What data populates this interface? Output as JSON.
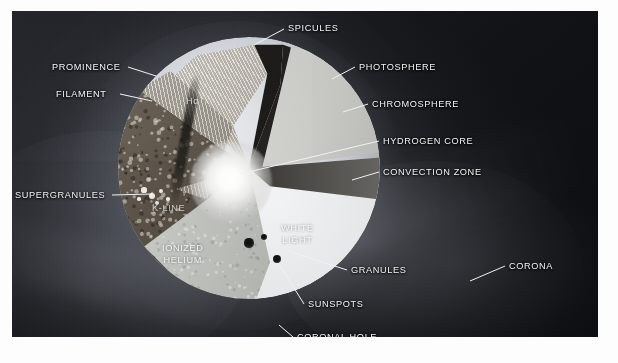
{
  "figure": {
    "background_color": "#14151a",
    "label_color": "#f3f4f6"
  },
  "callouts": [
    {
      "id": "spicules",
      "label": "SPICULES",
      "text_x": 288,
      "text_y": 23,
      "align": "left",
      "leader": [
        284,
        29,
        254,
        45
      ]
    },
    {
      "id": "photosphere",
      "label": "PHOTOSPHERE",
      "text_x": 359,
      "text_y": 62,
      "align": "left",
      "leader": [
        355,
        67,
        332,
        79
      ]
    },
    {
      "id": "chromosphere",
      "label": "CHROMOSPHERE",
      "text_x": 372,
      "text_y": 99,
      "align": "left",
      "leader": [
        368,
        104,
        343,
        112
      ]
    },
    {
      "id": "hydrogen-core",
      "label": "HYDROGEN CORE",
      "text_x": 383,
      "text_y": 136,
      "align": "left",
      "leader": [
        379,
        141,
        240,
        174
      ]
    },
    {
      "id": "convection-zone",
      "label": "CONVECTION ZONE",
      "text_x": 383,
      "text_y": 167,
      "align": "left",
      "leader": [
        379,
        172,
        352,
        180
      ]
    },
    {
      "id": "prominence",
      "label": "PROMINENCE",
      "text_x": 52,
      "text_y": 62,
      "align": "left",
      "leader": [
        128,
        67,
        156,
        76
      ]
    },
    {
      "id": "filament",
      "label": "FILAMENT",
      "text_x": 56,
      "text_y": 89,
      "align": "left",
      "leader": [
        120,
        94,
        152,
        101
      ]
    },
    {
      "id": "supergranules",
      "label": "SUPERGRANULES",
      "text_x": 15,
      "text_y": 190,
      "align": "left",
      "leader": [
        112,
        195,
        152,
        194
      ]
    },
    {
      "id": "granules",
      "label": "GRANULES",
      "text_x": 351,
      "text_y": 265,
      "align": "left",
      "leader": [
        347,
        270,
        288,
        251
      ]
    },
    {
      "id": "sunspots",
      "label": "SUNSPOTS",
      "text_x": 308,
      "text_y": 299,
      "align": "left",
      "leader": [
        304,
        304,
        279,
        264
      ]
    },
    {
      "id": "corona",
      "label": "CORONA",
      "text_x": 509,
      "text_y": 261,
      "align": "left",
      "leader": [
        505,
        266,
        470,
        281
      ]
    },
    {
      "id": "coronal-hole",
      "label": "CORONAL HOLE",
      "text_x": 297,
      "text_y": 332,
      "align": "left",
      "leader": [
        293,
        337,
        279,
        325
      ]
    }
  ],
  "inner_labels": [
    {
      "id": "k-line",
      "label": "K-LINE",
      "x": 152,
      "y": 203,
      "dim": true
    },
    {
      "id": "ionized-helium",
      "label": "IONIZED\nHELIUM",
      "x": 162,
      "y": 243,
      "dim": false
    },
    {
      "id": "white-light",
      "label": "WHITE\nLIGHT",
      "x": 281,
      "y": 223,
      "dim": false
    },
    {
      "id": "h-alpha",
      "label": "Hα",
      "x": 186,
      "y": 96,
      "dim": true
    }
  ],
  "sunspots": [
    {
      "x": 249,
      "y": 243,
      "r": 4.6
    },
    {
      "x": 264,
      "y": 237,
      "r": 3.2
    },
    {
      "x": 277,
      "y": 259,
      "r": 4.0
    }
  ],
  "supergranule_dots": [
    {
      "x": 144,
      "y": 190,
      "r": 2.6
    },
    {
      "x": 152,
      "y": 196,
      "r": 3.4
    },
    {
      "x": 161,
      "y": 191,
      "r": 2.4
    },
    {
      "x": 157,
      "y": 203,
      "r": 2.2
    },
    {
      "x": 168,
      "y": 199,
      "r": 1.8
    },
    {
      "x": 139,
      "y": 199,
      "r": 1.7
    }
  ]
}
